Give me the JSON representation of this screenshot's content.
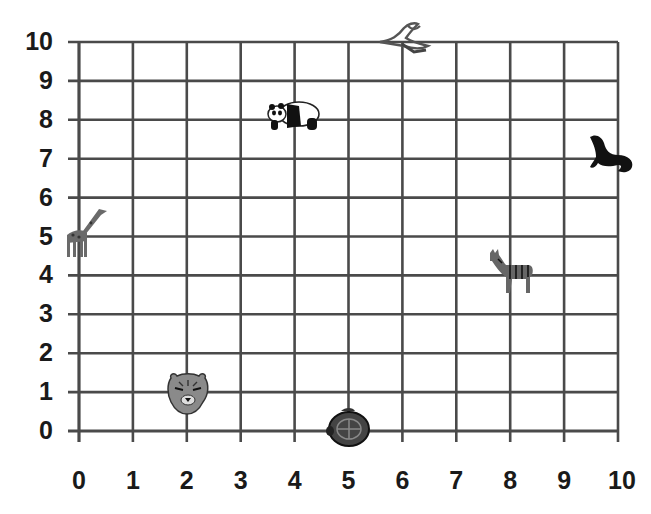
{
  "chart_data": {
    "type": "scatter",
    "title": "",
    "xlabel": "",
    "ylabel": "",
    "xlim": [
      0,
      10
    ],
    "ylim": [
      0,
      10
    ],
    "grid": true,
    "legend": "none",
    "x_ticks": [
      "0",
      "1",
      "2",
      "3",
      "4",
      "5",
      "6",
      "7",
      "8",
      "9",
      "10"
    ],
    "y_ticks": [
      "0",
      "1",
      "2",
      "3",
      "4",
      "5",
      "6",
      "7",
      "8",
      "9",
      "10"
    ],
    "points": [
      {
        "label": "bird",
        "x": 6,
        "y": 10
      },
      {
        "label": "panda",
        "x": 4,
        "y": 8
      },
      {
        "label": "seal",
        "x": 10,
        "y": 7
      },
      {
        "label": "giraffe",
        "x": 0,
        "y": 5
      },
      {
        "label": "zebra",
        "x": 8,
        "y": 4
      },
      {
        "label": "tiger",
        "x": 2,
        "y": 1
      },
      {
        "label": "turtle",
        "x": 5,
        "y": 0
      }
    ]
  },
  "colors": {
    "grid": "#4a4a4a",
    "labels": "#1a1a1a",
    "background": "#ffffff"
  },
  "layout": {
    "x0_px": 79,
    "x10_px": 618,
    "y0_px": 431,
    "y10_px": 42
  }
}
